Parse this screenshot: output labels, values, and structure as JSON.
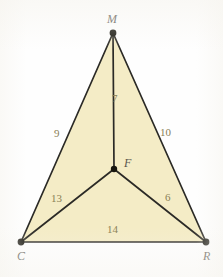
{
  "figure": {
    "background_color": "#fefefe",
    "fill_color": "#f4ecc6",
    "stroke_color": "#2b2a26",
    "vertex_dot_color": "#17160f",
    "segment_label_color": "#8a8055",
    "vertex_label_color": "#58554d",
    "vertices": [
      {
        "name": "M",
        "label": "M",
        "x": 113,
        "y": 33,
        "label_x": 107,
        "label_y": 13
      },
      {
        "name": "C",
        "label": "C",
        "x": 21,
        "y": 242,
        "label_x": 17,
        "label_y": 250
      },
      {
        "name": "R",
        "label": "R",
        "x": 206,
        "y": 242,
        "label_x": 203,
        "label_y": 250
      },
      {
        "name": "F",
        "label": "F",
        "x": 114,
        "y": 169,
        "label_x": 124,
        "label_y": 157
      }
    ],
    "segments": [
      {
        "name": "MF",
        "from": "M",
        "to": "F",
        "label": "7",
        "label_x": 112,
        "label_y": 93
      },
      {
        "name": "MC",
        "from": "M",
        "to": "C",
        "label": "9",
        "label_x": 54,
        "label_y": 128
      },
      {
        "name": "MR",
        "from": "M",
        "to": "R",
        "label": "10",
        "label_x": 160,
        "label_y": 127
      },
      {
        "name": "CF",
        "from": "C",
        "to": "F",
        "label": "13",
        "label_x": 51,
        "label_y": 193
      },
      {
        "name": "FR",
        "from": "F",
        "to": "R",
        "label": "6",
        "label_x": 165,
        "label_y": 192
      },
      {
        "name": "CR",
        "from": "C",
        "to": "R",
        "label": "14",
        "label_x": 107,
        "label_y": 224
      }
    ]
  }
}
